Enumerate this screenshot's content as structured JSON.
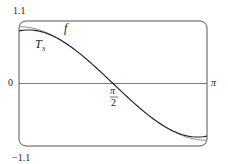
{
  "chart_data": {
    "type": "line",
    "title": "",
    "xlabel": "",
    "ylabel": "",
    "xlim": [
      0,
      3.14159
    ],
    "ylim": [
      -1.1,
      1.1
    ],
    "grid": false,
    "x_tick_labels": [
      "π/2",
      "π"
    ],
    "y_tick_labels": [
      "1.1",
      "0",
      "−1.1"
    ],
    "series": [
      {
        "name": "f",
        "expression": "cos x",
        "x": [
          0,
          0.3927,
          0.7854,
          1.1781,
          1.5708,
          1.9635,
          2.3562,
          2.7489,
          3.1416
        ],
        "values": [
          1.0,
          0.924,
          0.707,
          0.383,
          0.0,
          -0.383,
          -0.707,
          -0.924,
          -1.0
        ]
      },
      {
        "name": "T_3",
        "expression": "-(x-π/2) + (x-π/2)^3/6",
        "x": [
          0,
          0.3927,
          0.7854,
          1.1781,
          1.5708,
          1.9635,
          2.3562,
          2.7489,
          3.1416
        ],
        "values": [
          0.925,
          0.905,
          0.705,
          0.383,
          0.0,
          -0.383,
          -0.705,
          -0.905,
          -0.925
        ]
      }
    ],
    "annotations": [
      "f",
      "T_3"
    ]
  },
  "labels": {
    "y_top": "1.1",
    "y_zero": "0",
    "y_bottom": "−1.1",
    "x_pi": "π",
    "x_pi_half_num": "π",
    "x_pi_half_den": "2",
    "f": "f",
    "t3_main": "T",
    "t3_sub": "3"
  }
}
